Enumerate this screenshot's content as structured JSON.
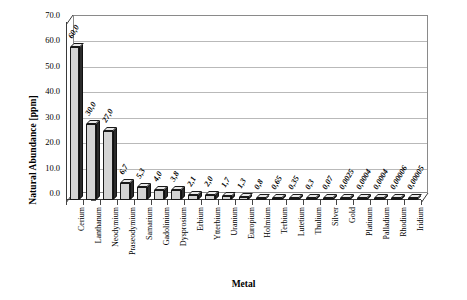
{
  "chart_data": {
    "type": "bar",
    "title": "",
    "xlabel": "Metal",
    "ylabel": "Natural Abundance [ppm]",
    "ylim": [
      0.0,
      70.0
    ],
    "ytick_labels": [
      "0.0",
      "10.0",
      "20.0",
      "30.0",
      "40.0",
      "50.0",
      "60.0",
      "70.0"
    ],
    "ytick_values": [
      0.0,
      10.0,
      20.0,
      30.0,
      40.0,
      50.0,
      60.0,
      70.0
    ],
    "grid": true,
    "legend": false,
    "style": "3d-column",
    "categories": [
      "Cerium",
      "Lanthanum",
      "Neodymium",
      "Praseodymium",
      "Samarium",
      "Gadolinium",
      "Dysprosium",
      "Erbium",
      "Ytterbium",
      "Uranium",
      "Europium",
      "Holmium",
      "Terbium",
      "Lutetium",
      "Thulium",
      "Silver",
      "Gold",
      "Platinum",
      "Palladium",
      "Rhodium",
      "Iridium"
    ],
    "values": [
      60.0,
      30.0,
      27.0,
      6.7,
      5.3,
      4.0,
      3.8,
      2.1,
      2.0,
      1.7,
      1.3,
      0.8,
      0.65,
      0.35,
      0.3,
      0.07,
      0.0025,
      0.0004,
      0.0004,
      6e-05,
      5e-05
    ],
    "data_labels": [
      "60,0",
      "30,0",
      "27,0",
      "6,7",
      "5,3",
      "4,0",
      "3,8",
      "2,1",
      "2,0",
      "1,7",
      "1,3",
      "0,8",
      "0,65",
      "0,35",
      "0,3",
      "0,07",
      "0,0025",
      "0,0004",
      "0,0004",
      "0,00006",
      "0,00005"
    ],
    "colors": {
      "bar_fill": "#d4d4d4",
      "bar_outline": "#1a1a1a",
      "bar_side": "#2b2b2b",
      "gridline": "#b9b9b9",
      "axis": "#3a3a3a",
      "background": "#ffffff",
      "text": "#000000"
    }
  }
}
